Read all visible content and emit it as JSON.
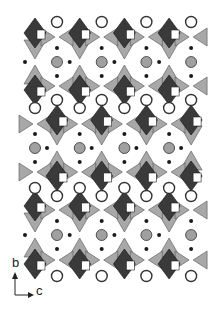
{
  "figure": {
    "type": "crystal-structure-polyhedral-projection",
    "axes": {
      "vertical": "b",
      "horizontal": "c"
    },
    "colors": {
      "dark_polyhedra": "#3a3a3a",
      "light_polyhedra": "#a8a8a8",
      "gray_atom": "#a0a0a0",
      "small_dot": "#1a1a1a",
      "open_atom_stroke": "#333333",
      "background": "#ffffff"
    },
    "repeat_c_px": 44.7,
    "layers": [
      {
        "name": "layer-1",
        "center_y": 62,
        "gray_x0": 57,
        "diamonds_top_y": 33,
        "diamonds_bottom_y": 90,
        "diamond_x0": 35
      },
      {
        "name": "layer-2",
        "center_y": 148,
        "gray_x0": 35,
        "diamonds_top_y": 120,
        "diamonds_bottom_y": 176,
        "diamond_x0": 57
      },
      {
        "name": "layer-3",
        "center_y": 235,
        "gray_x0": 57,
        "diamonds_top_y": 206,
        "diamonds_bottom_y": 264,
        "diamond_x0": 35
      }
    ],
    "open_atom_rows": [
      {
        "y": 22,
        "x0": 57
      },
      {
        "y": 100,
        "x0": 57
      },
      {
        "y": 108,
        "x0": 35
      },
      {
        "y": 188,
        "x0": 35
      },
      {
        "y": 196,
        "x0": 57
      },
      {
        "y": 276,
        "x0": 57
      }
    ]
  },
  "axis_labels": {
    "b": "b",
    "c": "c"
  }
}
